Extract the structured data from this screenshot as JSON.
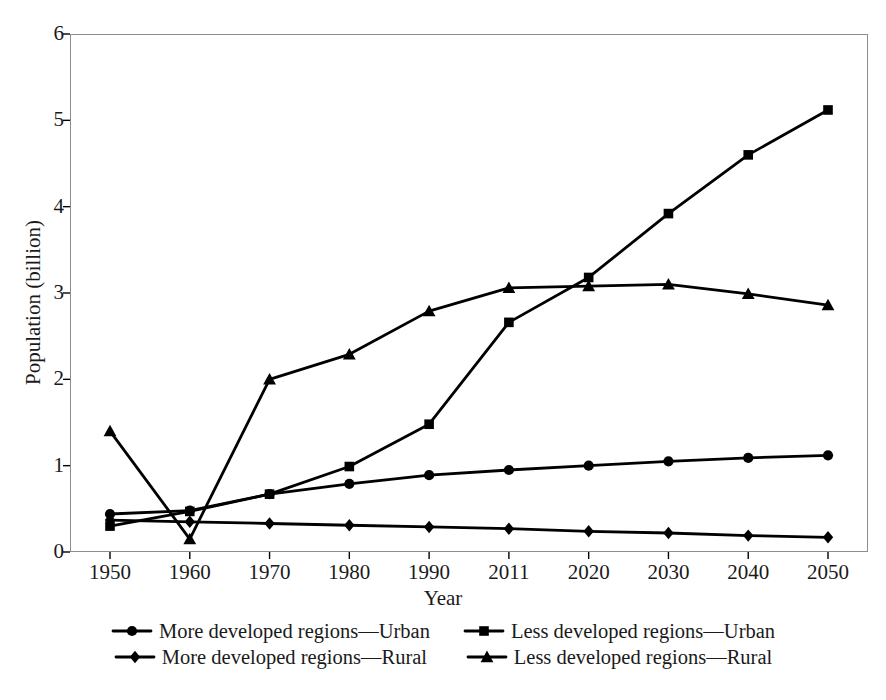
{
  "chart_data": {
    "type": "line",
    "title": "",
    "xlabel": "Year",
    "ylabel": "Population (billion)",
    "categories": [
      "1950",
      "1960",
      "1970",
      "1980",
      "1990",
      "2011",
      "2020",
      "2030",
      "2040",
      "2050"
    ],
    "xtick_labels": [
      "1950",
      "1960",
      "1970",
      "1980",
      "1990",
      "2011",
      "2020",
      "2030",
      "2040",
      "2050"
    ],
    "ytick_labels": [
      "0",
      "1",
      "2",
      "3",
      "4",
      "5",
      "6"
    ],
    "ytick_values": [
      0,
      1,
      2,
      3,
      4,
      5,
      6
    ],
    "ylim": [
      0,
      6
    ],
    "grid": false,
    "legend_position": "bottom",
    "series": [
      {
        "name": "More developed regions—Urban",
        "marker": "circle",
        "color": "#000000",
        "values": [
          0.44,
          0.48,
          0.67,
          0.79,
          0.89,
          0.95,
          1.0,
          1.05,
          1.09,
          1.12
        ]
      },
      {
        "name": "Less developed regions—Urban",
        "marker": "square",
        "color": "#000000",
        "values": [
          0.3,
          0.47,
          0.67,
          0.99,
          1.48,
          2.66,
          3.18,
          3.92,
          4.6,
          5.12
        ]
      },
      {
        "name": "More developed regions—Rural",
        "marker": "diamond",
        "color": "#000000",
        "values": [
          0.37,
          0.35,
          0.33,
          0.31,
          0.29,
          0.27,
          0.24,
          0.22,
          0.19,
          0.17
        ]
      },
      {
        "name": "Less developed regions—Rural",
        "marker": "triangle",
        "color": "#000000",
        "values": [
          1.4,
          0.15,
          2.0,
          2.29,
          2.79,
          3.06,
          3.08,
          3.1,
          2.99,
          2.86
        ]
      }
    ]
  },
  "axes": {
    "x_title": "Year",
    "y_title": "Population (billion)"
  },
  "legend": {
    "rows": [
      [
        {
          "label": "More developed regions—Urban",
          "marker": "circle"
        },
        {
          "label": "Less developed regions—Urban",
          "marker": "square"
        }
      ],
      [
        {
          "label": "More developed regions—Rural",
          "marker": "diamond"
        },
        {
          "label": "Less developed regions—Rural",
          "marker": "triangle"
        }
      ]
    ]
  },
  "style": {
    "ink": "#000000",
    "frame": "#8d8d8d",
    "background": "#ffffff"
  }
}
